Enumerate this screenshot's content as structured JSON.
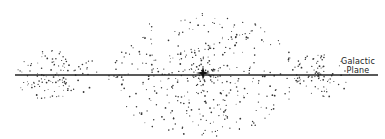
{
  "diagram": {
    "label_line1": "Galactic",
    "label_line2": "Plane",
    "plane": {
      "x1": 15,
      "x2": 378,
      "y": 75,
      "color": "#222222"
    },
    "center_star": {
      "x": 203,
      "y": 73,
      "size": 7,
      "color": "#111111"
    },
    "clusters": [
      {
        "name": "left-cluster",
        "cx": 58,
        "cy": 76,
        "rx": 42,
        "ry": 26,
        "count": 120,
        "seed": 11
      },
      {
        "name": "central-bulge",
        "cx": 203,
        "cy": 75,
        "rx": 95,
        "ry": 62,
        "count": 420,
        "seed": 29
      },
      {
        "name": "right-cluster",
        "cx": 318,
        "cy": 76,
        "rx": 32,
        "ry": 22,
        "count": 90,
        "seed": 47
      }
    ],
    "dot_color": "#333333"
  }
}
